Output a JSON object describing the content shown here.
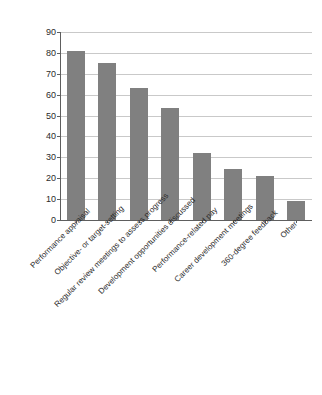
{
  "chart_data": {
    "type": "bar",
    "title": "",
    "xlabel": "",
    "ylabel": "",
    "ylim": [
      0,
      90
    ],
    "grid": true,
    "legend": "none",
    "orientation": "vertical",
    "bar_color": "#808080",
    "categories": [
      "Performance appraisal",
      "Objective- or target-setting",
      "Regular review meetings to assess progress",
      "Development opportunities discussed",
      "Performance-related pay",
      "Career development meetings",
      "360-degree feedback",
      "Other"
    ],
    "values": [
      81,
      75,
      63,
      53.5,
      32,
      24.5,
      21,
      9
    ],
    "ytick_labels": [
      "90",
      "80",
      "70",
      "60",
      "50",
      "40",
      "30",
      "20",
      "10",
      "0"
    ],
    "ytick_values": [
      90,
      80,
      70,
      60,
      50,
      40,
      30,
      20,
      10,
      0
    ]
  }
}
